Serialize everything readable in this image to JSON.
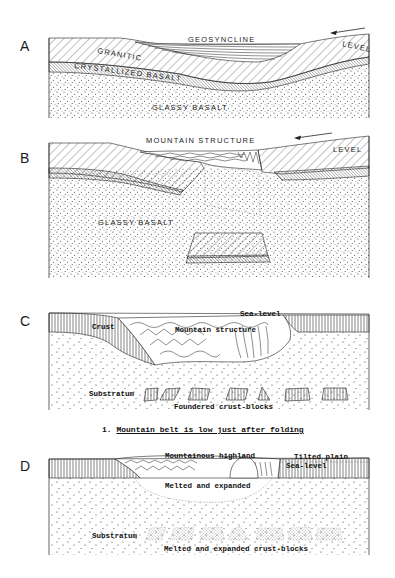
{
  "figure": {
    "panels": [
      {
        "id": "A",
        "letter": "A",
        "labels": {
          "geosyncline": "GEOSYNCLINE",
          "level": "LEVEL",
          "granitic": "GRANITIC",
          "crystallized_basalt": "CRYSTALLIZED BASALT",
          "glassy_basalt": "GLASSY BASALT"
        },
        "arrow_direction": "left"
      },
      {
        "id": "B",
        "letter": "B",
        "labels": {
          "mountain_structure": "MOUNTAIN STRUCTURE",
          "level": "LEVEL",
          "glassy_basalt": "GLASSY BASALT"
        },
        "arrow_direction": "left"
      },
      {
        "id": "C",
        "letter": "C",
        "labels": {
          "sea_level": "Sea-level",
          "crust": "Crust",
          "mountain_structure": "Mountain structure",
          "substratum": "Substratum",
          "foundered_blocks": "Foundered crust-blocks"
        }
      },
      {
        "id": "D",
        "letter": "D",
        "labels": {
          "mountainous_highland": "Mountainous highland",
          "tilted_plain": "Tilted plain",
          "sea_level": "Sea-level",
          "melted_expanded": "Melted and expanded",
          "substratum": "Substratum",
          "melted_blocks": "Melted and expanded crust-blocks"
        }
      }
    ],
    "caption": {
      "number": "1.",
      "text": "Mountain belt is low just after folding"
    },
    "colors": {
      "ink": "#1a1a1a",
      "paper": "#ffffff"
    }
  }
}
